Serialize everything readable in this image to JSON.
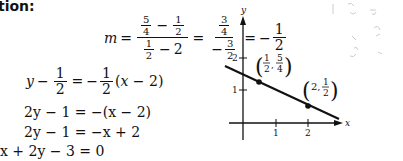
{
  "heading": "tion:",
  "equations": {
    "slope": {
      "lhs": "m",
      "frac1_num_a": "5",
      "frac1_num_a_den": "4",
      "frac1_num_b": "1",
      "frac1_num_b_den": "2",
      "frac1_den_a": "1",
      "frac1_den_a_den": "2",
      "frac1_den_b": "2",
      "frac2_num": "3",
      "frac2_num_den": "4",
      "frac2_den": "3",
      "frac2_den_den": "2",
      "result_num": "1",
      "result_den": "2"
    },
    "line1": "y − 1/2 = −1/2(x − 2)",
    "line2": "2y − 1 = −(x − 2)",
    "line3": "2y − 1 = −x + 2",
    "line4": "x + 2y − 3 = 0"
  },
  "graph": {
    "x_axis_label": "x",
    "y_axis_label": "y",
    "x_ticks": [
      "1",
      "2"
    ],
    "y_ticks": [
      "1",
      "2"
    ],
    "point1_label": "(1/2, 5/4)",
    "point2_label": "(2, 1/2)",
    "line_color": "#111111"
  }
}
